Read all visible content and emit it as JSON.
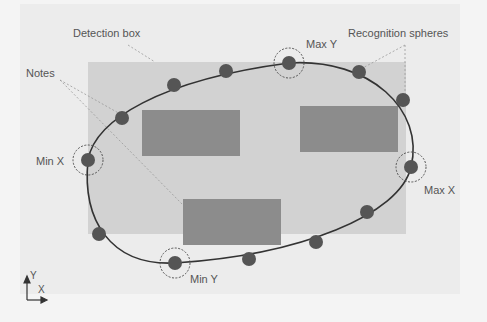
{
  "diagram": {
    "labels": {
      "detection_box": "Detection box",
      "recognition_spheres": "Recognition spheres",
      "notes": "Notes",
      "max_y": "Max Y",
      "min_x": "Min X",
      "max_x": "Max X",
      "min_y": "Min Y",
      "axis_y": "Y",
      "axis_x": "X"
    },
    "colors": {
      "background": "#f4f4f4",
      "panel": "#ececec",
      "detection_box": "#d2d2d2",
      "note": "#8c8c8c",
      "sphere": "#555555",
      "curve": "#333333",
      "leader": "#999999"
    },
    "detection_box": {
      "x": 88,
      "y": 62,
      "w": 318,
      "h": 172
    },
    "notes": [
      {
        "x": 142,
        "y": 110,
        "w": 98,
        "h": 46
      },
      {
        "x": 300,
        "y": 106,
        "w": 98,
        "h": 46
      },
      {
        "x": 183,
        "y": 199,
        "w": 98,
        "h": 46
      }
    ],
    "spheres": [
      {
        "x": 88,
        "y": 160,
        "extreme": "min_x"
      },
      {
        "x": 122,
        "y": 118
      },
      {
        "x": 174,
        "y": 85
      },
      {
        "x": 226,
        "y": 71
      },
      {
        "x": 289,
        "y": 63,
        "extreme": "max_y"
      },
      {
        "x": 359,
        "y": 72
      },
      {
        "x": 403,
        "y": 100
      },
      {
        "x": 411,
        "y": 167,
        "extreme": "max_x"
      },
      {
        "x": 367,
        "y": 212
      },
      {
        "x": 316,
        "y": 242
      },
      {
        "x": 249,
        "y": 259
      },
      {
        "x": 175,
        "y": 263,
        "extreme": "min_y"
      },
      {
        "x": 99,
        "y": 234
      }
    ]
  }
}
